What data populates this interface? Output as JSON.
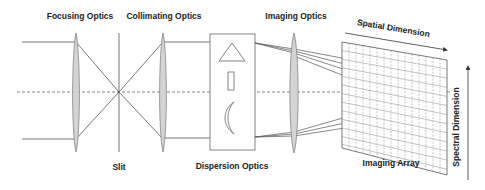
{
  "diagram": {
    "labels": {
      "focusing_optics": "Focusing Optics",
      "collimating_optics": "Collimating Optics",
      "imaging_optics": "Imaging Optics",
      "slit": "Slit",
      "dispersion_optics": "Dispersion Optics",
      "imaging_array": "Imaging Array",
      "spatial_dimension": "Spatial Dimension",
      "spectral_dimension": "Spectral Dimension"
    },
    "components": [
      {
        "id": "focusing-lens",
        "type": "lens"
      },
      {
        "id": "slit",
        "type": "aperture"
      },
      {
        "id": "collimating-lens",
        "type": "lens"
      },
      {
        "id": "dispersion-box",
        "type": "dispersive-elements",
        "elements": [
          "prism",
          "grating",
          "curved-mirror"
        ]
      },
      {
        "id": "imaging-lens",
        "type": "lens"
      },
      {
        "id": "imaging-array",
        "type": "detector-grid"
      }
    ],
    "colors": {
      "line": "#555555",
      "lens_fill": "#d4d4d4",
      "text": "#222222"
    }
  }
}
